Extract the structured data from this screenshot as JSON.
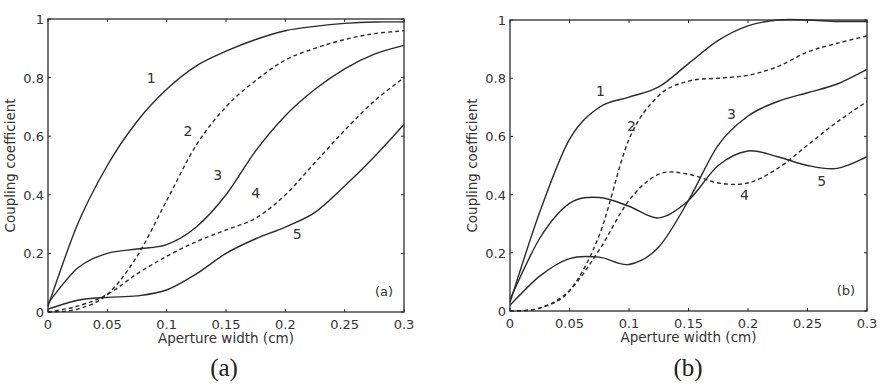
{
  "chart_data": [
    {
      "panel": "a",
      "type": "line",
      "title": "",
      "caption": "(a)",
      "panel_tag": "(a)",
      "xlabel": "Aperture width (cm)",
      "ylabel": "Coupling coefficient",
      "xlim": [
        0,
        0.3
      ],
      "ylim": [
        0,
        1
      ],
      "grid": false,
      "xticks": [
        0,
        0.05,
        0.1,
        0.15,
        0.2,
        0.25,
        0.3
      ],
      "xtick_labels": [
        "0",
        "0.05",
        "0.1",
        "0.15",
        "0.2",
        "0.25",
        "0.3"
      ],
      "yticks": [
        0,
        0.2,
        0.4,
        0.6,
        0.8,
        1
      ],
      "ytick_labels": [
        "0",
        "0.2",
        "0.4",
        "0.6",
        "0.8",
        "1"
      ],
      "x": [
        0,
        0.025,
        0.05,
        0.075,
        0.1,
        0.125,
        0.15,
        0.175,
        0.2,
        0.225,
        0.25,
        0.275,
        0.3
      ],
      "series": [
        {
          "name": "1",
          "style": "solid",
          "values": [
            0.02,
            0.3,
            0.5,
            0.65,
            0.76,
            0.84,
            0.89,
            0.93,
            0.96,
            0.975,
            0.985,
            0.99,
            0.99
          ],
          "label_pos": [
            0.087,
            0.78
          ]
        },
        {
          "name": "2",
          "style": "dashed",
          "values": [
            0,
            0.01,
            0.06,
            0.19,
            0.38,
            0.57,
            0.7,
            0.79,
            0.86,
            0.9,
            0.93,
            0.95,
            0.96
          ],
          "label_pos": [
            0.118,
            0.6
          ]
        },
        {
          "name": "3",
          "style": "solid",
          "values": [
            0.03,
            0.15,
            0.2,
            0.215,
            0.23,
            0.29,
            0.4,
            0.55,
            0.67,
            0.76,
            0.83,
            0.88,
            0.91
          ],
          "label_pos": [
            0.143,
            0.45
          ]
        },
        {
          "name": "4",
          "style": "dashed",
          "values": [
            0,
            0.02,
            0.06,
            0.13,
            0.19,
            0.24,
            0.28,
            0.32,
            0.4,
            0.51,
            0.62,
            0.72,
            0.8
          ],
          "label_pos": [
            0.175,
            0.39
          ]
        },
        {
          "name": "5",
          "style": "solid",
          "values": [
            0.01,
            0.04,
            0.05,
            0.055,
            0.075,
            0.13,
            0.2,
            0.25,
            0.29,
            0.34,
            0.43,
            0.53,
            0.64
          ],
          "label_pos": [
            0.21,
            0.25
          ]
        }
      ]
    },
    {
      "panel": "b",
      "type": "line",
      "title": "",
      "caption": "(b)",
      "panel_tag": "(b)",
      "xlabel": "Aperture width (cm)",
      "ylabel": "Coupling coefficient",
      "xlim": [
        0,
        0.3
      ],
      "ylim": [
        0,
        1
      ],
      "grid": false,
      "xticks": [
        0,
        0.05,
        0.1,
        0.15,
        0.2,
        0.25,
        0.3
      ],
      "xtick_labels": [
        "0",
        "0.05",
        "0.1",
        "0.15",
        "0.2",
        "0.25",
        "0.3"
      ],
      "yticks": [
        0,
        0.2,
        0.4,
        0.6,
        0.8,
        1
      ],
      "ytick_labels": [
        "0",
        "0.2",
        "0.4",
        "0.6",
        "0.8",
        "1"
      ],
      "x": [
        0,
        0.025,
        0.05,
        0.075,
        0.1,
        0.125,
        0.15,
        0.175,
        0.2,
        0.225,
        0.25,
        0.275,
        0.3
      ],
      "series": [
        {
          "name": "1",
          "style": "solid",
          "values": [
            0.03,
            0.34,
            0.59,
            0.7,
            0.735,
            0.77,
            0.85,
            0.93,
            0.98,
            1.0,
            1.0,
            0.995,
            0.995
          ],
          "label_pos": [
            0.076,
            0.74
          ]
        },
        {
          "name": "2",
          "style": "dashed",
          "values": [
            0,
            0.01,
            0.07,
            0.26,
            0.59,
            0.74,
            0.79,
            0.8,
            0.81,
            0.84,
            0.89,
            0.92,
            0.945
          ],
          "label_pos": [
            0.102,
            0.62
          ]
        },
        {
          "name": "3",
          "style": "solid",
          "values": [
            0.02,
            0.12,
            0.18,
            0.185,
            0.16,
            0.22,
            0.38,
            0.57,
            0.67,
            0.72,
            0.75,
            0.78,
            0.83
          ],
          "label_pos": [
            0.186,
            0.66
          ]
        },
        {
          "name": "4",
          "style": "dashed",
          "values": [
            0,
            0.01,
            0.07,
            0.21,
            0.38,
            0.47,
            0.47,
            0.44,
            0.44,
            0.49,
            0.57,
            0.65,
            0.72
          ],
          "label_pos": [
            0.197,
            0.38
          ]
        },
        {
          "name": "5",
          "style": "solid",
          "values": [
            0.04,
            0.25,
            0.37,
            0.39,
            0.36,
            0.32,
            0.38,
            0.5,
            0.55,
            0.53,
            0.5,
            0.49,
            0.53
          ],
          "label_pos": [
            0.262,
            0.43
          ]
        }
      ]
    }
  ],
  "layout": {
    "panels": [
      {
        "x0": 48,
        "x1": 404,
        "y0": 312,
        "y1": 19,
        "caption_x": 224,
        "caption_y": 376,
        "tag_x": 384,
        "tag_y": 296
      },
      {
        "x0": 510,
        "x1": 867,
        "y0": 311,
        "y1": 20,
        "caption_x": 688,
        "caption_y": 376,
        "tag_x": 846,
        "tag_y": 295
      }
    ],
    "line_color": "#2b2b2b"
  }
}
